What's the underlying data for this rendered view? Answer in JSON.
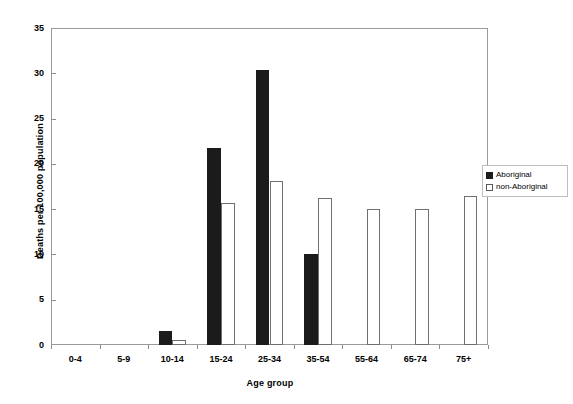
{
  "chart_data": {
    "type": "bar",
    "title": "",
    "xlabel": "Age group",
    "ylabel": "Deaths per 100,000 population",
    "categories": [
      "0-4",
      "5-9",
      "10-14",
      "15-24",
      "25-34",
      "35-54",
      "55-64",
      "65-74",
      "75+"
    ],
    "series": [
      {
        "name": "Aboriginal",
        "color": "#1b1b1b",
        "values": [
          0,
          0,
          1.5,
          21.8,
          30.4,
          10.1,
          0,
          0,
          0
        ]
      },
      {
        "name": "non-Aboriginal",
        "color": "#ffffff",
        "values": [
          0,
          0,
          0.6,
          15.7,
          18.1,
          16.2,
          15.0,
          15.0,
          16.5
        ]
      }
    ],
    "ylim": [
      0,
      35
    ],
    "yticks": [
      0,
      5,
      10,
      15,
      20,
      25,
      30,
      35
    ],
    "ytick_labels": [
      "0",
      "5",
      "10",
      "15",
      "20",
      "25",
      "30",
      "35"
    ],
    "grid": false,
    "legend_position": "right"
  },
  "legend": {
    "entries": [
      {
        "label": "Aboriginal",
        "swatch": "filled-square-icon"
      },
      {
        "label": "non-Aboriginal",
        "swatch": "outline-square-icon"
      }
    ]
  }
}
